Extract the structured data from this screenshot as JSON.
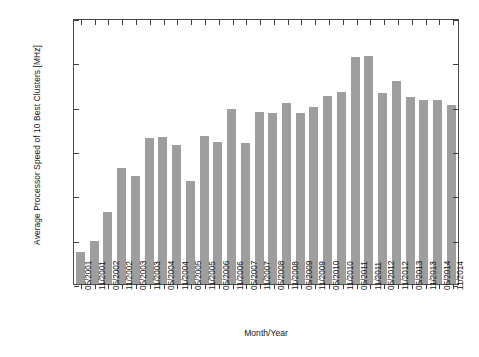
{
  "chart_data": {
    "type": "bar",
    "title": "",
    "xlabel": "Month/Year",
    "ylabel": "Average Processor Speed of 10 Best Clusters [MHz]",
    "ylim": [
      0,
      3000
    ],
    "yticks": [
      0,
      500,
      1000,
      1500,
      2000,
      2500,
      3000
    ],
    "grid": false,
    "legend": null,
    "bar_color": "#9e9e9e",
    "axis_color": "#3c3c3c",
    "categories": [
      "05/2001",
      "11/2001",
      "05/2002",
      "11/2002",
      "05/2003",
      "11/2003",
      "05/2004",
      "11/2004",
      "05/2005",
      "11/2005",
      "05/2006",
      "11/2006",
      "05/2007",
      "11/2007",
      "05/2008",
      "11/2008",
      "05/2009",
      "11/2009",
      "05/2010",
      "11/2010",
      "05/2011",
      "11/2011",
      "05/2012",
      "11/2012",
      "05/2013",
      "11/2013",
      "05/2014",
      "11/2014"
    ],
    "values": [
      360,
      485,
      810,
      1310,
      1215,
      1645,
      1655,
      1565,
      1160,
      1670,
      1600,
      1975,
      1590,
      1940,
      1930,
      2040,
      1930,
      2000,
      2120,
      2170,
      2560,
      2570,
      2155,
      2285,
      2105,
      2080,
      2080,
      2020
    ]
  }
}
